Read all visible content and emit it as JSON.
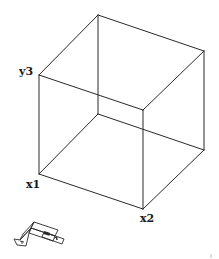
{
  "figure": {
    "type": "wireframe-cube",
    "labels": {
      "y3": "y3",
      "x1": "x1",
      "x2": "x2"
    },
    "vertices": [
      "top-back",
      "top-left",
      "top-right",
      "top-front",
      "bottom-back",
      "bottom-left",
      "bottom-right",
      "bottom-front"
    ],
    "edges": [
      [
        "top-back",
        "top-left"
      ],
      [
        "top-back",
        "top-right"
      ],
      [
        "top-left",
        "top-front"
      ],
      [
        "top-right",
        "top-front"
      ],
      [
        "bottom-back",
        "bottom-left"
      ],
      [
        "bottom-back",
        "bottom-right"
      ],
      [
        "bottom-left",
        "bottom-front"
      ],
      [
        "bottom-right",
        "bottom-front"
      ],
      [
        "top-back",
        "bottom-back"
      ],
      [
        "top-left",
        "bottom-left"
      ],
      [
        "top-right",
        "bottom-right"
      ],
      [
        "top-front",
        "bottom-front"
      ]
    ]
  },
  "ucs_icon": {
    "name": "ucs-icon",
    "axis_letters": [
      "Y",
      "X"
    ],
    "color": "#2a2a2a"
  }
}
